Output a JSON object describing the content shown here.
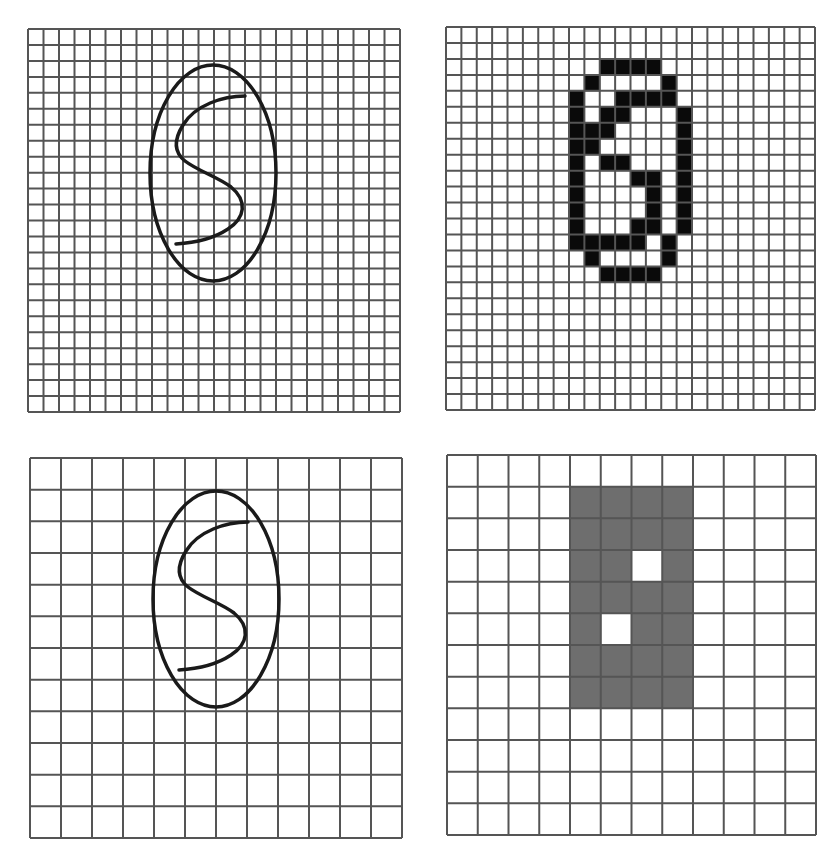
{
  "figure": {
    "line_color": "#555555",
    "stroke_color": "#1a1a1a",
    "fill_black": "#0a0a0a",
    "fill_gray": "#6e6e6e",
    "background": "#ffffff"
  },
  "panels": [
    {
      "id": "top-left",
      "name": "fine-grid-handwritten-s",
      "x": 28,
      "y": 29,
      "width": 372,
      "height": 383,
      "rows": 24,
      "cols": 24,
      "type": "stroke",
      "ellipse": {
        "cx": 185,
        "cy": 144,
        "rx": 63,
        "ry": 108
      },
      "character": "S"
    },
    {
      "id": "top-right",
      "name": "fine-grid-digitized",
      "x": 446,
      "y": 27,
      "width": 369,
      "height": 383,
      "rows": 24,
      "cols": 24,
      "type": "cells",
      "fill": "black",
      "filled_cells": {
        "2": [
          10,
          11,
          12,
          13
        ],
        "3": [
          9,
          14
        ],
        "4": [
          8,
          11,
          12,
          13,
          14
        ],
        "5": [
          8,
          10,
          11,
          15
        ],
        "6": [
          8,
          9,
          10,
          15
        ],
        "7": [
          8,
          9,
          15
        ],
        "8": [
          8,
          10,
          11,
          15
        ],
        "9": [
          8,
          12,
          13,
          15
        ],
        "10": [
          8,
          13,
          15
        ],
        "11": [
          8,
          13,
          15
        ],
        "12": [
          8,
          12,
          13,
          15
        ],
        "13": [
          8,
          9,
          10,
          11,
          12,
          14
        ],
        "14": [
          9,
          14
        ],
        "15": [
          10,
          11,
          12,
          13
        ]
      }
    },
    {
      "id": "bottom-left",
      "name": "coarse-grid-handwritten-s",
      "x": 30,
      "y": 458,
      "width": 372,
      "height": 380,
      "rows": 12,
      "cols": 12,
      "type": "stroke",
      "ellipse": {
        "cx": 186,
        "cy": 141,
        "rx": 63,
        "ry": 108
      },
      "character": "S"
    },
    {
      "id": "bottom-right",
      "name": "coarse-grid-digitized",
      "x": 447,
      "y": 455,
      "width": 369,
      "height": 380,
      "rows": 12,
      "cols": 12,
      "type": "cells",
      "fill": "gray",
      "filled_cells": {
        "1": [
          4,
          5,
          6,
          7
        ],
        "2": [
          4,
          5,
          6,
          7
        ],
        "3": [
          4,
          5,
          7
        ],
        "4": [
          4,
          5,
          6,
          7
        ],
        "5": [
          4,
          6,
          7
        ],
        "6": [
          4,
          5,
          6,
          7
        ],
        "7": [
          4,
          5,
          6,
          7
        ]
      }
    }
  ]
}
